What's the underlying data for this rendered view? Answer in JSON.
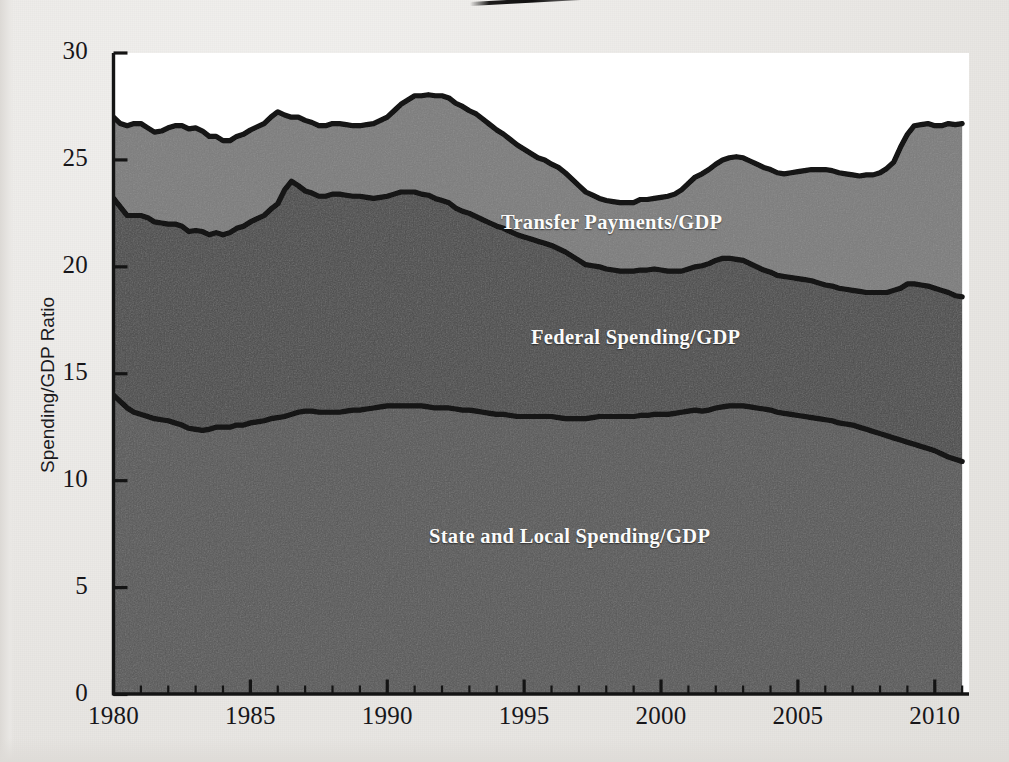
{
  "figure": {
    "background_color": "#eceae7",
    "plot_background_color": "#ffffff",
    "artifact": "scan-streak"
  },
  "axes": {
    "y_axis_title": "Spending/GDP Ratio",
    "y_ticks": [
      "0",
      "5",
      "10",
      "15",
      "20",
      "25",
      "30"
    ],
    "x_ticks": [
      "1980",
      "1985",
      "1990",
      "1995",
      "2000",
      "2005",
      "2010"
    ],
    "y_range": [
      0,
      30
    ],
    "x_range": [
      1980,
      2011.25
    ],
    "y_tick_step": 5,
    "x_major_tick_step": 5,
    "x_minor_tick_step": 1
  },
  "series_labels": {
    "transfer": "Transfer Payments/GDP",
    "federal": "Federal Spending/GDP",
    "state_local": "State and Local Spending/GDP"
  },
  "colors": {
    "band_state_local": "#575757",
    "band_federal": "#4a4a4a",
    "band_transfer": "#7b7b7b",
    "line": "#121212",
    "label_text": "#fbfbfa",
    "axis_text": "#17161a"
  },
  "chart_data": {
    "type": "area",
    "title": "",
    "subtitle": "",
    "xlabel": "",
    "ylabel": "Spending/GDP Ratio",
    "xlim": [
      1980,
      2011.25
    ],
    "ylim": [
      0,
      30
    ],
    "grid": false,
    "legend_position": "in-plot-annotations",
    "stacked": true,
    "note": "Cumulative boundary lines: state_local_cum = State and Local Spending/GDP; federal_cum = State and Local + Federal Spending; total_cum = + Transfer Payments. Values are quarterly, read off the y-axis in percent of GDP.",
    "x": [
      1980.0,
      1980.25,
      1980.5,
      1980.75,
      1981.0,
      1981.25,
      1981.5,
      1981.75,
      1982.0,
      1982.25,
      1982.5,
      1982.75,
      1983.0,
      1983.25,
      1983.5,
      1983.75,
      1984.0,
      1984.25,
      1984.5,
      1984.75,
      1985.0,
      1985.25,
      1985.5,
      1985.75,
      1986.0,
      1986.25,
      1986.5,
      1986.75,
      1987.0,
      1987.25,
      1987.5,
      1987.75,
      1988.0,
      1988.25,
      1988.5,
      1988.75,
      1989.0,
      1989.25,
      1989.5,
      1989.75,
      1990.0,
      1990.25,
      1990.5,
      1990.75,
      1991.0,
      1991.25,
      1991.5,
      1991.75,
      1992.0,
      1992.25,
      1992.5,
      1992.75,
      1993.0,
      1993.25,
      1993.5,
      1993.75,
      1994.0,
      1994.25,
      1994.5,
      1994.75,
      1995.0,
      1995.25,
      1995.5,
      1995.75,
      1996.0,
      1996.25,
      1996.5,
      1996.75,
      1997.0,
      1997.25,
      1997.5,
      1997.75,
      1998.0,
      1998.25,
      1998.5,
      1998.75,
      1999.0,
      1999.25,
      1999.5,
      1999.75,
      2000.0,
      2000.25,
      2000.5,
      2000.75,
      2001.0,
      2001.25,
      2001.5,
      2001.75,
      2002.0,
      2002.25,
      2002.5,
      2002.75,
      2003.0,
      2003.25,
      2003.5,
      2003.75,
      2004.0,
      2004.25,
      2004.5,
      2004.75,
      2005.0,
      2005.25,
      2005.5,
      2005.75,
      2006.0,
      2006.25,
      2006.5,
      2006.75,
      2007.0,
      2007.25,
      2007.5,
      2007.75,
      2008.0,
      2008.25,
      2008.5,
      2008.75,
      2009.0,
      2009.25,
      2009.5,
      2009.75,
      2010.0,
      2010.25,
      2010.5,
      2010.75,
      2011.0
    ],
    "series": [
      {
        "name": "State and Local Spending/GDP",
        "color": "#575757",
        "values": [
          14.0,
          13.7,
          13.4,
          13.2,
          13.1,
          13.0,
          12.9,
          12.85,
          12.8,
          12.7,
          12.6,
          12.45,
          12.4,
          12.35,
          12.4,
          12.5,
          12.5,
          12.5,
          12.6,
          12.6,
          12.7,
          12.75,
          12.8,
          12.9,
          12.95,
          13.0,
          13.1,
          13.2,
          13.25,
          13.25,
          13.2,
          13.2,
          13.2,
          13.2,
          13.25,
          13.3,
          13.3,
          13.35,
          13.4,
          13.45,
          13.5,
          13.5,
          13.5,
          13.5,
          13.5,
          13.5,
          13.45,
          13.4,
          13.4,
          13.4,
          13.35,
          13.3,
          13.3,
          13.25,
          13.2,
          13.15,
          13.1,
          13.1,
          13.05,
          13.0,
          13.0,
          13.0,
          13.0,
          13.0,
          13.0,
          12.95,
          12.9,
          12.9,
          12.9,
          12.9,
          12.95,
          13.0,
          13.0,
          13.0,
          13.0,
          13.0,
          13.0,
          13.05,
          13.05,
          13.1,
          13.1,
          13.1,
          13.15,
          13.2,
          13.25,
          13.3,
          13.25,
          13.3,
          13.4,
          13.45,
          13.5,
          13.5,
          13.5,
          13.45,
          13.4,
          13.35,
          13.3,
          13.2,
          13.15,
          13.1,
          13.05,
          13.0,
          12.95,
          12.9,
          12.85,
          12.8,
          12.7,
          12.65,
          12.6,
          12.5,
          12.4,
          12.3,
          12.2,
          12.1,
          12.0,
          11.9,
          11.8,
          11.7,
          11.6,
          11.5,
          11.4,
          11.25,
          11.1,
          11.0,
          10.9
        ]
      },
      {
        "name": "Federal Spending/GDP",
        "color": "#4a4a4a",
        "values": [
          9.2,
          9.1,
          9.0,
          9.2,
          9.3,
          9.3,
          9.2,
          9.2,
          9.2,
          9.3,
          9.3,
          9.2,
          9.3,
          9.3,
          9.1,
          9.1,
          9.0,
          9.1,
          9.2,
          9.3,
          9.4,
          9.5,
          9.6,
          9.8,
          10.0,
          10.6,
          10.9,
          10.6,
          10.3,
          10.2,
          10.1,
          10.1,
          10.2,
          10.2,
          10.1,
          10.0,
          10.0,
          9.9,
          9.8,
          9.8,
          9.8,
          9.9,
          10.0,
          10.0,
          10.0,
          9.9,
          9.9,
          9.8,
          9.7,
          9.6,
          9.4,
          9.3,
          9.2,
          9.1,
          9.0,
          8.9,
          8.8,
          8.7,
          8.6,
          8.5,
          8.4,
          8.3,
          8.2,
          8.1,
          8.0,
          7.9,
          7.8,
          7.6,
          7.4,
          7.2,
          7.1,
          7.0,
          6.9,
          6.85,
          6.8,
          6.8,
          6.8,
          6.8,
          6.8,
          6.8,
          6.75,
          6.7,
          6.65,
          6.6,
          6.65,
          6.7,
          6.8,
          6.85,
          6.9,
          6.95,
          6.9,
          6.85,
          6.8,
          6.7,
          6.6,
          6.5,
          6.45,
          6.4,
          6.4,
          6.4,
          6.4,
          6.4,
          6.4,
          6.35,
          6.3,
          6.3,
          6.3,
          6.3,
          6.3,
          6.35,
          6.4,
          6.5,
          6.6,
          6.7,
          6.9,
          7.1,
          7.4,
          7.5,
          7.55,
          7.6,
          7.6,
          7.65,
          7.7,
          7.65,
          7.7
        ]
      },
      {
        "name": "Transfer Payments/GDP",
        "color": "#7b7b7b",
        "values": [
          3.8,
          3.9,
          4.2,
          4.3,
          4.3,
          4.2,
          4.2,
          4.3,
          4.5,
          4.6,
          4.7,
          4.8,
          4.8,
          4.7,
          4.6,
          4.5,
          4.4,
          4.3,
          4.3,
          4.3,
          4.3,
          4.3,
          4.3,
          4.3,
          4.3,
          3.5,
          3.0,
          3.2,
          3.3,
          3.3,
          3.3,
          3.3,
          3.3,
          3.3,
          3.3,
          3.3,
          3.3,
          3.4,
          3.5,
          3.6,
          3.7,
          3.9,
          4.1,
          4.3,
          4.5,
          4.6,
          4.7,
          4.8,
          4.9,
          4.9,
          4.9,
          4.9,
          4.8,
          4.8,
          4.7,
          4.6,
          4.5,
          4.4,
          4.3,
          4.2,
          4.1,
          4.0,
          3.9,
          3.9,
          3.8,
          3.8,
          3.7,
          3.6,
          3.5,
          3.4,
          3.3,
          3.2,
          3.2,
          3.2,
          3.2,
          3.2,
          3.2,
          3.3,
          3.3,
          3.3,
          3.4,
          3.5,
          3.6,
          3.8,
          4.0,
          4.2,
          4.3,
          4.4,
          4.5,
          4.6,
          4.7,
          4.8,
          4.8,
          4.8,
          4.8,
          4.8,
          4.8,
          4.8,
          4.8,
          4.9,
          5.0,
          5.1,
          5.2,
          5.3,
          5.4,
          5.4,
          5.4,
          5.4,
          5.4,
          5.4,
          5.5,
          5.5,
          5.6,
          5.8,
          6.0,
          6.6,
          7.0,
          7.4,
          7.5,
          7.6,
          7.6,
          7.7,
          7.9,
          8.0,
          8.1
        ]
      }
    ],
    "annotations": [
      {
        "text": "Transfer Payments/GDP",
        "x": 1998.0,
        "y": 22.0
      },
      {
        "text": "Federal Spending/GDP",
        "x": 1999.0,
        "y": 16.8
      },
      {
        "text": "State and Local Spending/GDP",
        "x": 1996.5,
        "y": 8.0
      }
    ]
  }
}
